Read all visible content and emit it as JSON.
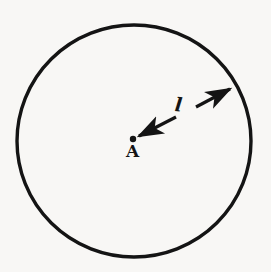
{
  "figure": {
    "type": "geometry-diagram",
    "background_color": "#f8f7f5",
    "ink_color": "#141414",
    "labels": {
      "center_point": "A",
      "radius": "l"
    },
    "shapes": {
      "circle": {
        "name": "circle-outline",
        "center_x": 134,
        "center_y": 141,
        "radius_x": 117,
        "radius_y": 116,
        "stroke_width": 3.4,
        "stroke_color": "#141414",
        "fill": "none"
      },
      "center_dot": {
        "name": "center-point-dot",
        "cx": 133,
        "cy": 139,
        "r": 3.2,
        "fill": "#141414"
      },
      "radius_arrow": {
        "name": "radius-double-arrow",
        "from_x": 139,
        "from_y": 136,
        "to_x": 232,
        "to_y": 87,
        "break_start_x": 176,
        "break_start_y": 117,
        "break_end_x": 196,
        "break_end_y": 107,
        "stroke_width": 3.2,
        "double_headed": true
      }
    }
  },
  "chart_data": {
    "type": "diagram",
    "elements": [
      {
        "id": "circle",
        "label": "",
        "description": "circle outline",
        "center": [
          134,
          141
        ],
        "radius": 116
      },
      {
        "id": "center",
        "label": "A",
        "description": "centre point of the circle",
        "position": [
          133,
          139
        ]
      },
      {
        "id": "radius",
        "label": "l",
        "description": "double-headed arrow from centre A to circumference denoting the radius",
        "from": [
          139,
          136
        ],
        "to": [
          232,
          87
        ],
        "label_position": [
          183,
          105
        ]
      }
    ],
    "annotations": [
      "A",
      "l"
    ],
    "legend": [],
    "grid": false
  }
}
